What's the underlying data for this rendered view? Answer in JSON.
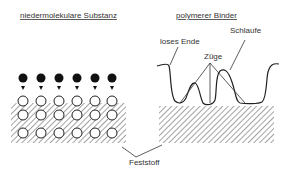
{
  "left_panel": {
    "title": "niedermolekulare Substanz",
    "molecule_count": 6,
    "surface_rows": 3
  },
  "right_panel": {
    "title": "polymerer Binder",
    "labels": {
      "loose_end": "loses Ende",
      "trains": "Züge",
      "loop": "Schlaufe"
    }
  },
  "shared": {
    "solid_label": "Feststoff"
  },
  "colors": {
    "ink": "#222222",
    "hatch": "#555555"
  }
}
